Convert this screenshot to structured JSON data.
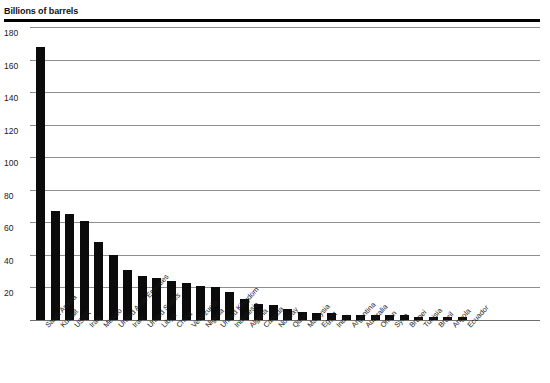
{
  "chart_data": {
    "type": "bar",
    "title": "Billions of barrels",
    "xlabel": "",
    "ylabel": "Billions of barrels",
    "ylim": [
      0,
      180
    ],
    "yticks": [
      180,
      160,
      140,
      120,
      100,
      80,
      60,
      40,
      20
    ],
    "grid": true,
    "legend": "none",
    "orientation": "vertical",
    "bar_color": "#0b0b0b",
    "categories": [
      "Saudi Arabia",
      "Kuwait",
      "USSR",
      "Iraq",
      "Mexico",
      "United Arab Emirates",
      "Iran",
      "United States",
      "Libya",
      "China",
      "Venezuela",
      "Nigeria",
      "United Kingdom",
      "Indonesia",
      "Algeria",
      "Canada",
      "Norway",
      "Qatar",
      "Malaysia",
      "Egypt",
      "India",
      "Argentina",
      "Australia",
      "Oman",
      "Syria",
      "Brunei",
      "Tunisia",
      "Brazil",
      "Angola",
      "Ecuador"
    ],
    "values": [
      168,
      67,
      65,
      61,
      48,
      40,
      31,
      27,
      26,
      24,
      23,
      21,
      20,
      17,
      13,
      10,
      9,
      7,
      5,
      4,
      4,
      3,
      3,
      3,
      3,
      3,
      2,
      2,
      2,
      2
    ]
  }
}
